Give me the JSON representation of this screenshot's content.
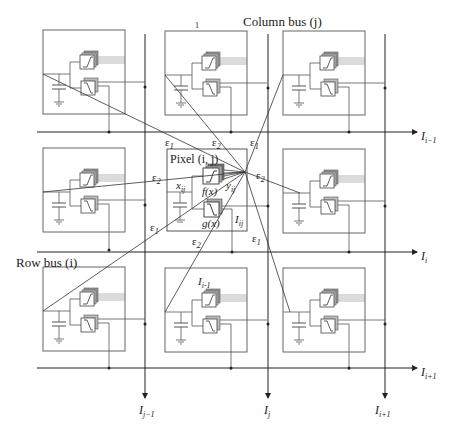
{
  "labels": {
    "column_bus": "Column bus (j)",
    "row_bus": "Row bus (i)",
    "pixel": "Pixel (i, j)",
    "top_mark": "1",
    "x_ij": "x",
    "x_ij_sub": "ij",
    "y_ij": "y",
    "y_ij_sub": "ij",
    "I_ij": "I",
    "I_ij_sub": "ij",
    "f_x": "f(x)",
    "g_x": "g(x)",
    "I_inner": "I",
    "I_inner_sub": "i-1"
  },
  "row_outputs": [
    {
      "main": "I",
      "sub": "i−1"
    },
    {
      "main": "I",
      "sub": "i"
    },
    {
      "main": "I",
      "sub": "i+1"
    }
  ],
  "column_outputs": [
    {
      "main": "I",
      "sub": "j−1"
    },
    {
      "main": "I",
      "sub": "j"
    },
    {
      "main": "I",
      "sub": "i+1"
    }
  ],
  "epsilon_labels": [
    {
      "text": "ε",
      "sub": "1"
    },
    {
      "text": "ε",
      "sub": "2"
    },
    {
      "text": "ε",
      "sub": "1"
    },
    {
      "text": "ε",
      "sub": "2"
    },
    {
      "text": "ε",
      "sub": "2"
    },
    {
      "text": "ε",
      "sub": "1"
    },
    {
      "text": "ε",
      "sub": "2"
    },
    {
      "text": "ε",
      "sub": "1"
    }
  ],
  "colors": {
    "line": "#333333",
    "box": "#555555",
    "component_fill": "#ffffff",
    "component_shadow": "#888888"
  }
}
